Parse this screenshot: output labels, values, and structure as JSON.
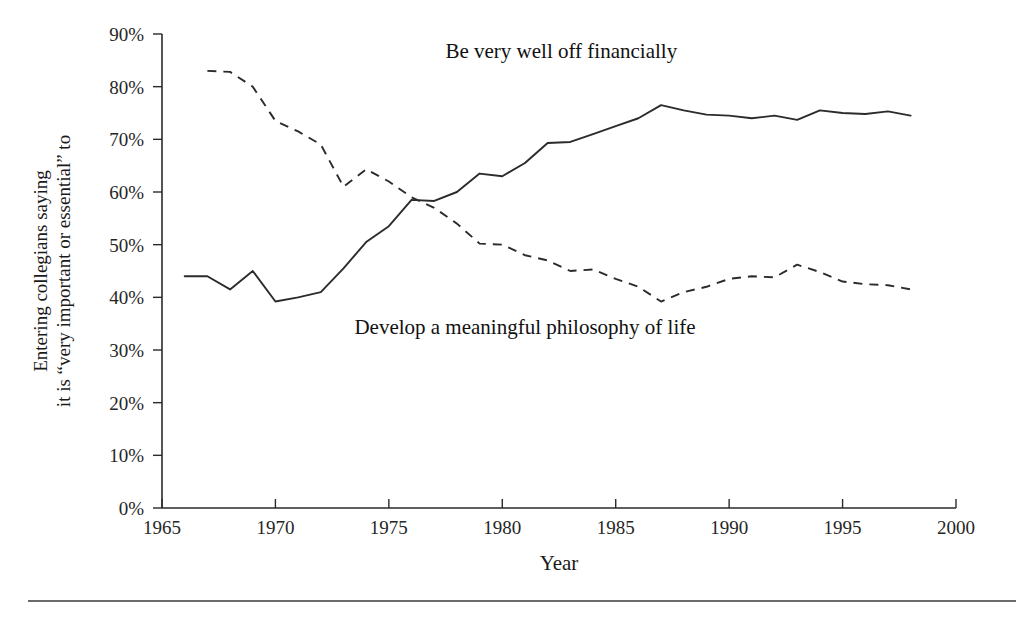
{
  "chart_data": {
    "type": "line",
    "title": "",
    "xlabel": "Year",
    "ylabel": "Entering collegians saying it is “very important or essential” to",
    "ylabel_line1": "Entering collegians saying",
    "ylabel_line2": "it is “very important or essential” to",
    "xlim": [
      1965,
      2000
    ],
    "ylim": [
      0,
      90
    ],
    "xticks": [
      1965,
      1970,
      1975,
      1980,
      1985,
      1990,
      1995,
      2000
    ],
    "xtick_labels": [
      "1965",
      "1970",
      "1975",
      "1980",
      "1985",
      "1990",
      "1995",
      "2000"
    ],
    "yticks": [
      0,
      10,
      20,
      30,
      40,
      50,
      60,
      70,
      80,
      90
    ],
    "ytick_labels": [
      "0%",
      "10%",
      "20%",
      "30%",
      "40%",
      "50%",
      "60%",
      "70%",
      "80%",
      "90%"
    ],
    "grid": false,
    "legend": "inline-annotations",
    "line_color": "#2b2b2b",
    "series": [
      {
        "name": "Be very well off financially",
        "style": "solid",
        "label_x": 1982.6,
        "label_y": 85.5,
        "x": [
          1966,
          1967,
          1968,
          1969,
          1970,
          1971,
          1972,
          1973,
          1974,
          1975,
          1976,
          1977,
          1978,
          1979,
          1980,
          1981,
          1982,
          1983,
          1984,
          1985,
          1986,
          1987,
          1988,
          1989,
          1990,
          1991,
          1992,
          1993,
          1994,
          1995,
          1996,
          1997,
          1998
        ],
        "values": [
          44.0,
          44.0,
          41.5,
          45.0,
          39.2,
          40.0,
          41.0,
          45.5,
          50.5,
          53.5,
          58.5,
          58.3,
          60.0,
          63.5,
          63.0,
          65.5,
          69.3,
          69.5,
          71.0,
          72.5,
          74.0,
          76.5,
          75.5,
          74.7,
          74.5,
          74.0,
          74.5,
          73.7,
          75.5,
          75.0,
          74.8,
          75.3,
          74.5
        ]
      },
      {
        "name": "Develop a meaningful philosophy of life",
        "style": "dashed",
        "label_x": 1981.0,
        "label_y": 33.0,
        "x": [
          1967,
          1968,
          1969,
          1970,
          1971,
          1972,
          1973,
          1974,
          1975,
          1976,
          1977,
          1978,
          1979,
          1980,
          1981,
          1982,
          1983,
          1984,
          1985,
          1986,
          1987,
          1988,
          1989,
          1990,
          1991,
          1992,
          1993,
          1994,
          1995,
          1996,
          1997,
          1998
        ],
        "values": [
          83.0,
          82.8,
          80.0,
          73.5,
          71.5,
          69.0,
          61.0,
          64.3,
          62.0,
          59.0,
          57.0,
          54.0,
          50.2,
          50.0,
          48.0,
          47.0,
          45.0,
          45.3,
          43.5,
          42.0,
          39.2,
          41.0,
          42.0,
          43.5,
          44.0,
          43.8,
          46.2,
          44.8,
          43.0,
          42.5,
          42.3,
          41.5
        ]
      }
    ]
  },
  "figure": {
    "footer_rule_visible": true
  }
}
